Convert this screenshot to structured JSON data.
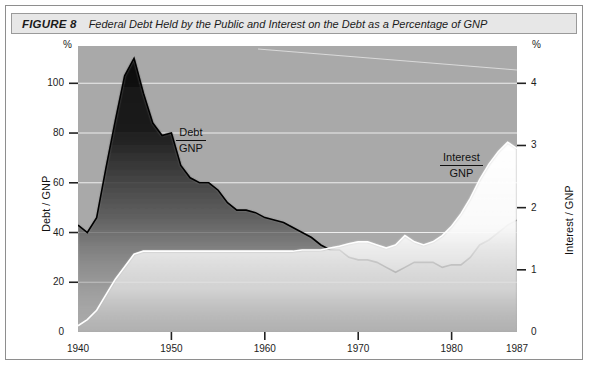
{
  "figure": {
    "label": "FIGURE 8",
    "caption": "Federal Debt Held by the Public and Interest on the Debt as a Percentage of GNP"
  },
  "axes": {
    "left_title": "Debt / GNP",
    "right_title": "Interest / GNP",
    "left_unit": "%",
    "right_unit": "%",
    "left_ticks": [
      "0",
      "20",
      "40",
      "60",
      "80",
      "100"
    ],
    "right_ticks": [
      "0",
      "1",
      "2",
      "3",
      "4"
    ],
    "x_ticks": [
      "1940",
      "1950",
      "1960",
      "1970",
      "1980",
      "1987"
    ]
  },
  "series_labels": {
    "debt_num": "Debt",
    "debt_den": "GNP",
    "interest_num": "Interest",
    "interest_den": "GNP"
  },
  "colors": {
    "plot_background": "#a9a9a9",
    "gridline": "#f2f2f2",
    "debt_series": "#151515",
    "interest_series": "#fbfbfb",
    "frame": "#8e8e8e",
    "caption_background": "#e7e7e7",
    "text": "#1b1b1b"
  },
  "chart_data": {
    "type": "area",
    "title": "Federal Debt Held by the Public and Interest on the Debt as a Percentage of GNP",
    "xlabel": "",
    "ylabel": "Debt / GNP",
    "y2label": "Interest / GNP",
    "xlim": [
      1940,
      1987
    ],
    "ylim": [
      0,
      115
    ],
    "y2lim": [
      0,
      4.6
    ],
    "grid": true,
    "legend": "in-plot labels",
    "x": [
      1940,
      1941,
      1942,
      1943,
      1944,
      1945,
      1946,
      1947,
      1948,
      1949,
      1950,
      1951,
      1952,
      1953,
      1954,
      1955,
      1956,
      1957,
      1958,
      1959,
      1960,
      1961,
      1962,
      1963,
      1964,
      1965,
      1966,
      1967,
      1968,
      1969,
      1970,
      1971,
      1972,
      1973,
      1974,
      1975,
      1976,
      1977,
      1978,
      1979,
      1980,
      1981,
      1982,
      1983,
      1984,
      1985,
      1986,
      1987
    ],
    "series": [
      {
        "name": "Debt / GNP",
        "axis": "left",
        "unit": "%",
        "color": "#151515",
        "values": [
          43,
          40,
          46,
          66,
          85,
          103,
          110,
          96,
          84,
          79,
          80,
          67,
          62,
          60,
          60,
          57,
          52,
          49,
          49,
          48,
          46,
          45,
          44,
          42,
          40,
          38,
          35,
          33,
          33,
          30,
          29,
          29,
          28,
          26,
          24,
          26,
          28,
          28,
          28,
          26,
          27,
          27,
          30,
          35,
          37,
          40,
          43,
          45
        ]
      },
      {
        "name": "Interest / GNP",
        "axis": "right",
        "unit": "%",
        "color": "#fbfbfb",
        "values": [
          0.1,
          0.2,
          0.35,
          0.6,
          0.85,
          1.05,
          1.25,
          1.3,
          1.3,
          1.3,
          1.3,
          1.3,
          1.3,
          1.3,
          1.3,
          1.3,
          1.3,
          1.3,
          1.3,
          1.3,
          1.3,
          1.3,
          1.3,
          1.3,
          1.32,
          1.32,
          1.32,
          1.35,
          1.38,
          1.42,
          1.45,
          1.45,
          1.4,
          1.35,
          1.4,
          1.55,
          1.45,
          1.4,
          1.45,
          1.55,
          1.7,
          1.9,
          2.15,
          2.45,
          2.7,
          2.9,
          3.05,
          2.95
        ]
      }
    ]
  }
}
